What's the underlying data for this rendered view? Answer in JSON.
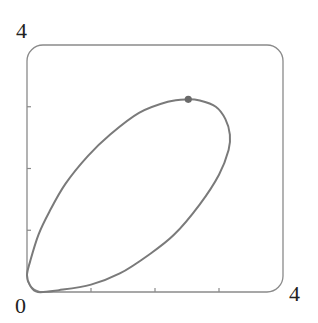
{
  "chart_data": {
    "type": "line",
    "title": "",
    "xlabel": "",
    "ylabel": "",
    "xlim": [
      0,
      4
    ],
    "ylim": [
      0,
      4
    ],
    "grid": false,
    "legend": null,
    "tick_labels": {
      "origin": "0",
      "x_max": "4",
      "y_max": "4"
    },
    "x_ticks": [
      1,
      2,
      3
    ],
    "y_ticks": [
      1,
      2,
      3
    ],
    "series": [
      {
        "name": "closed-orbit",
        "closed": true,
        "points": [
          [
            0.0,
            0.27
          ],
          [
            0.05,
            0.1
          ],
          [
            0.17,
            0.0
          ],
          [
            0.5,
            0.03
          ],
          [
            1.0,
            0.12
          ],
          [
            1.45,
            0.3
          ],
          [
            1.9,
            0.6
          ],
          [
            2.3,
            0.93
          ],
          [
            2.7,
            1.42
          ],
          [
            3.0,
            1.9
          ],
          [
            3.15,
            2.3
          ],
          [
            3.17,
            2.55
          ],
          [
            3.1,
            2.8
          ],
          [
            2.95,
            3.0
          ],
          [
            2.7,
            3.1
          ],
          [
            2.5,
            3.12
          ],
          [
            2.2,
            3.08
          ],
          [
            1.75,
            2.9
          ],
          [
            1.3,
            2.55
          ],
          [
            0.95,
            2.2
          ],
          [
            0.6,
            1.75
          ],
          [
            0.35,
            1.3
          ],
          [
            0.18,
            0.93
          ],
          [
            0.05,
            0.5
          ],
          [
            0.0,
            0.27
          ]
        ]
      }
    ],
    "annotations": [
      {
        "type": "marker",
        "x": 2.52,
        "y": 3.12,
        "label": ""
      }
    ],
    "colors": {
      "curve": "#7a7a7a",
      "frame": "#8a8a8a",
      "marker": "#6a6a6a",
      "text": "#222222"
    }
  }
}
